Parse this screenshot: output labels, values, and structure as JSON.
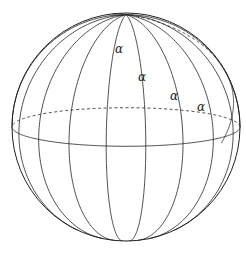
{
  "figure": {
    "sphere": {
      "cx": 126,
      "cy": 127,
      "r": 114
    },
    "meridian_count": 18,
    "equator": {
      "front_style": "solid",
      "back_style": "dashed"
    },
    "loxodrome": {
      "style": "solid"
    },
    "angle_label": "α",
    "angle_labels": [
      {
        "text": "α",
        "x": 120,
        "y": 53
      },
      {
        "text": "α",
        "x": 143,
        "y": 81
      },
      {
        "text": "α",
        "x": 175,
        "y": 100
      },
      {
        "text": "α",
        "x": 202,
        "y": 111
      }
    ],
    "stroke_color": "#222222"
  }
}
